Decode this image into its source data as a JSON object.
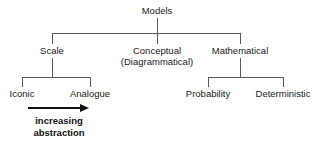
{
  "diagram": {
    "type": "tree",
    "root": {
      "label": "Models"
    },
    "level2": [
      {
        "label": "Scale"
      },
      {
        "label": "Conceptual",
        "label_line2": "(Diagrammatical)"
      },
      {
        "label": "Mathematical"
      }
    ],
    "level3_left": [
      {
        "label": "Iconic"
      },
      {
        "label": "Analogue"
      }
    ],
    "level3_right": [
      {
        "label": "Probability"
      },
      {
        "label": "Deterministic"
      }
    ],
    "annotation": {
      "line1": "increasing",
      "line2": "abstraction",
      "arrow_direction": "right"
    },
    "colors": {
      "line": "#5a5a5a",
      "text": "#1a1a1a",
      "annotation": "#111111",
      "background": "#ffffff"
    }
  }
}
